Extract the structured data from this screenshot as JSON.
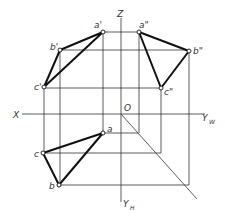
{
  "diagram": {
    "axes": {
      "x_label": "X",
      "z_label": "Z",
      "origin_label": "O",
      "yw_label": "Y",
      "yw_sub": "W",
      "yh_label": "Y",
      "yh_sub": "H"
    },
    "front_view": {
      "points": [
        {
          "label": "a'",
          "x": 103,
          "y": 32
        },
        {
          "label": "b'",
          "x": 60,
          "y": 50
        },
        {
          "label": "c'",
          "x": 44,
          "y": 87
        }
      ]
    },
    "side_view": {
      "points": [
        {
          "label": "a\"",
          "x": 139,
          "y": 32
        },
        {
          "label": "b\"",
          "x": 189,
          "y": 51
        },
        {
          "label": "c\"",
          "x": 161,
          "y": 88
        }
      ]
    },
    "top_view": {
      "points": [
        {
          "label": "a",
          "x": 103,
          "y": 133
        },
        {
          "label": "b",
          "x": 59,
          "y": 185
        },
        {
          "label": "c",
          "x": 43,
          "y": 153
        }
      ]
    },
    "colors": {
      "line": "#111111",
      "construction": "#333333",
      "background": "#ffffff"
    }
  }
}
